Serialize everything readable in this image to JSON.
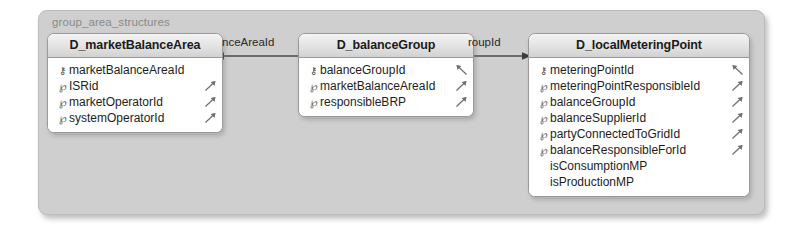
{
  "group": {
    "title": "group_area_structures"
  },
  "entities": [
    {
      "name": "D_marketBalanceArea",
      "fields": [
        {
          "icon": "primary-key-icon",
          "label": "marketBalanceAreaId",
          "fk": false
        },
        {
          "icon": "foreign-key-icon",
          "label": "ISRid",
          "fk": true
        },
        {
          "icon": "foreign-key-icon",
          "label": "marketOperatorId",
          "fk": true
        },
        {
          "icon": "foreign-key-icon",
          "label": "systemOperatorId",
          "fk": true
        }
      ]
    },
    {
      "name": "D_balanceGroup",
      "fields": [
        {
          "icon": "primary-key-icon",
          "label": "balanceGroupId",
          "fk": true
        },
        {
          "icon": "foreign-key-icon",
          "label": "marketBalanceAreaId",
          "fk": true
        },
        {
          "icon": "foreign-key-icon",
          "label": "responsibleBRP",
          "fk": true
        }
      ]
    },
    {
      "name": "D_localMeteringPoint",
      "fields": [
        {
          "icon": "primary-key-icon",
          "label": "meteringPointId",
          "fk": true
        },
        {
          "icon": "foreign-key-icon",
          "label": "meteringPointResponsibleId",
          "fk": true
        },
        {
          "icon": "foreign-key-icon",
          "label": "balanceGroupId",
          "fk": true
        },
        {
          "icon": "foreign-key-icon",
          "label": "balanceSupplierId",
          "fk": true
        },
        {
          "icon": "foreign-key-icon",
          "label": "partyConnectedToGridId",
          "fk": true
        },
        {
          "icon": "foreign-key-icon",
          "label": "balanceResponsibleForId",
          "fk": true
        },
        {
          "icon": "none",
          "label": "isConsumptionMP",
          "fk": false
        },
        {
          "icon": "none",
          "label": "isProductionMP",
          "fk": false
        }
      ]
    }
  ],
  "relationships": [
    {
      "label": "nceAreaId"
    },
    {
      "label": "roupId"
    }
  ],
  "colors": {
    "group_background": "#cfcfcf",
    "entity_background": "#ffffff",
    "header_background": "#e2e2e2",
    "border": "#9a9a9a",
    "text": "#1d1d1d",
    "group_title_text": "#8a8a8a"
  },
  "glyphs": {
    "primary_key": "⚷",
    "foreign_key": "ⱥ"
  }
}
